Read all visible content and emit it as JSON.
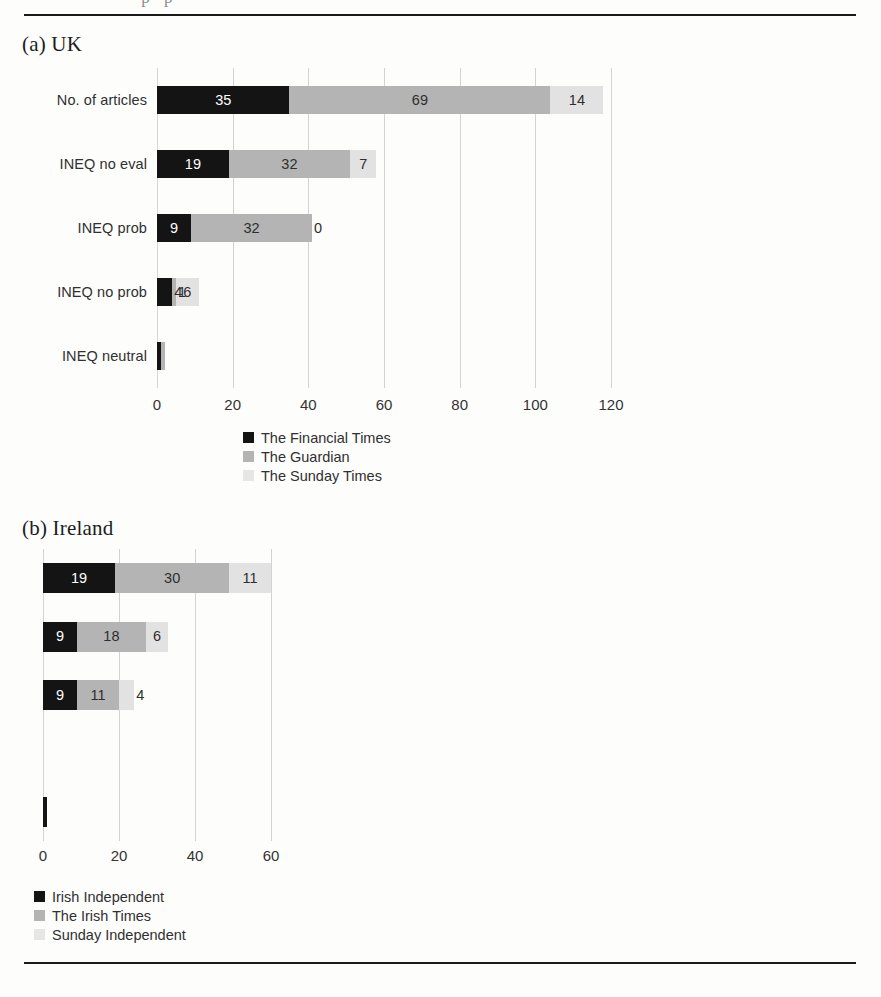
{
  "page": {
    "cutoff_text_top": "··· p · p ··"
  },
  "panel_a": {
    "title": "(a) UK"
  },
  "panel_b": {
    "title": "(b) Ireland"
  },
  "chart_data": [
    {
      "type": "bar",
      "orientation": "horizontal",
      "stacked": true,
      "title": "(a) UK",
      "xlabel": "",
      "ylabel": "",
      "xlim": [
        0,
        120
      ],
      "xticks": [
        "0",
        "20",
        "40",
        "60",
        "80",
        "100",
        "120"
      ],
      "grid": true,
      "legend_position": "bottom-center",
      "categories": [
        "No. of articles",
        "INEQ no eval",
        "INEQ prob",
        "INEQ no prob",
        "INEQ neutral"
      ],
      "series": [
        {
          "name": "The Financial Times",
          "color": "#141414",
          "values": [
            35,
            19,
            9,
            4,
            1
          ],
          "labels": [
            "35",
            "19",
            "9",
            "4",
            ""
          ]
        },
        {
          "name": "The Guardian",
          "color": "#b4b4b4",
          "values": [
            69,
            32,
            32,
            1,
            1
          ],
          "labels": [
            "69",
            "32",
            "32",
            "1",
            ""
          ]
        },
        {
          "name": "The Sunday Times",
          "color": "#e2e2e2",
          "values": [
            14,
            7,
            0,
            6,
            0
          ],
          "labels": [
            "14",
            "7",
            "0",
            "6",
            ""
          ]
        }
      ]
    },
    {
      "type": "bar",
      "orientation": "horizontal",
      "stacked": true,
      "title": "(b) Ireland",
      "xlabel": "",
      "ylabel": "",
      "xlim": [
        0,
        60
      ],
      "xticks": [
        "0",
        "20",
        "40",
        "60"
      ],
      "grid": true,
      "legend_position": "bottom-left",
      "categories": [
        "",
        "",
        "",
        "",
        ""
      ],
      "series": [
        {
          "name": "Irish Independent",
          "color": "#141414",
          "values": [
            19,
            9,
            9,
            0,
            1
          ],
          "labels": [
            "19",
            "9",
            "9",
            "",
            ""
          ]
        },
        {
          "name": "The Irish Times",
          "color": "#b4b4b4",
          "values": [
            30,
            18,
            11,
            0,
            0
          ],
          "labels": [
            "30",
            "18",
            "11",
            "",
            ""
          ]
        },
        {
          "name": "Sunday Independent",
          "color": "#e2e2e2",
          "values": [
            11,
            6,
            4,
            0,
            0
          ],
          "labels": [
            "11",
            "6",
            "4",
            "",
            ""
          ]
        }
      ]
    }
  ]
}
